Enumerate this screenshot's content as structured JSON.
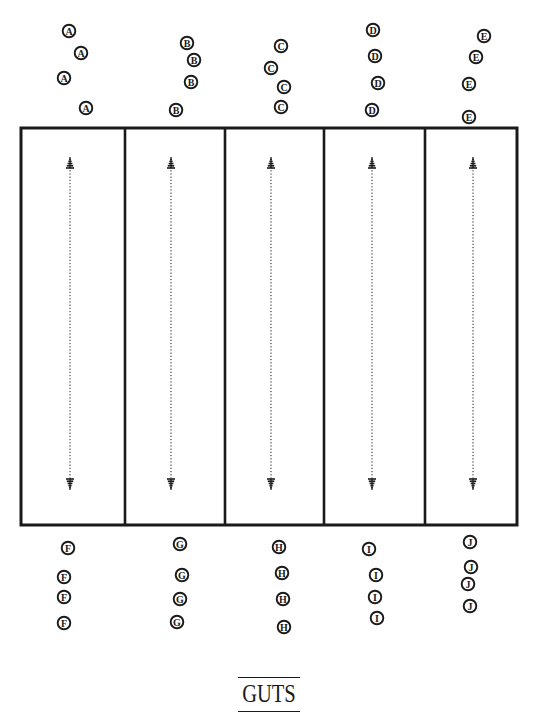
{
  "title": "GUTS",
  "colors": {
    "ink": "#1a1a1a",
    "paper": "#ffffff"
  },
  "field": {
    "lanes": 5,
    "lane_arrow": "two-headed dotted vertical arrow"
  },
  "teams": {
    "top": [
      {
        "letter": "A",
        "players": 4
      },
      {
        "letter": "B",
        "players": 4
      },
      {
        "letter": "C",
        "players": 4
      },
      {
        "letter": "D",
        "players": 4
      },
      {
        "letter": "E",
        "players": 4
      }
    ],
    "bottom": [
      {
        "letter": "F",
        "players": 4
      },
      {
        "letter": "G",
        "players": 4
      },
      {
        "letter": "H",
        "players": 4
      },
      {
        "letter": "I",
        "players": 4
      },
      {
        "letter": "J",
        "players": 4
      }
    ]
  }
}
